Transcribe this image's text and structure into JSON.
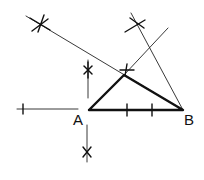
{
  "diagram": {
    "type": "geometric-construction",
    "points": {
      "A": {
        "label": "A",
        "x": 89,
        "y": 110
      },
      "B": {
        "label": "B",
        "x": 183,
        "y": 110
      },
      "C": {
        "label": "",
        "x": 124,
        "y": 75
      }
    },
    "labels": {
      "A": "A",
      "B": "B"
    },
    "colors": {
      "ink": "#111111",
      "background": "#ffffff"
    }
  }
}
